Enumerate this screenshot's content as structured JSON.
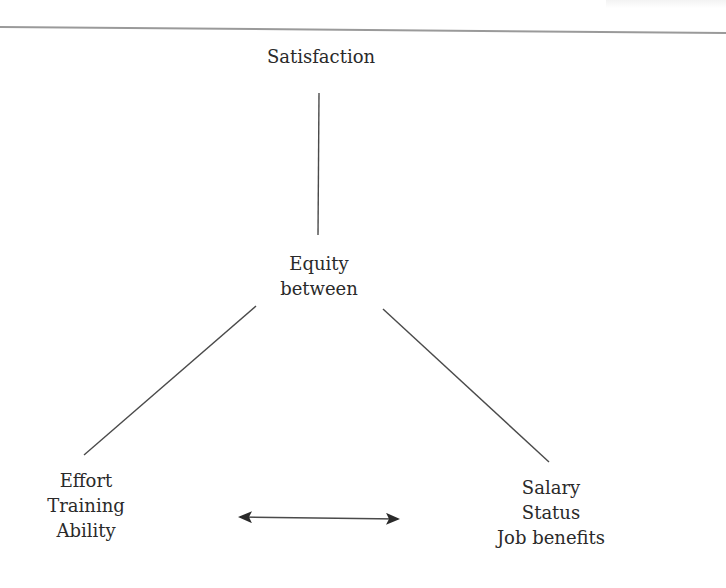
{
  "diagram": {
    "nodes": {
      "top": {
        "lines": [
          "Satisfaction"
        ]
      },
      "center": {
        "lines": [
          "Equity",
          "between"
        ]
      },
      "left": {
        "lines": [
          "Effort",
          "Training",
          "Ability"
        ]
      },
      "right": {
        "lines": [
          "Salary",
          "Status",
          "Job benefits"
        ]
      }
    },
    "edges": [
      {
        "from": "top",
        "to": "center",
        "type": "line"
      },
      {
        "from": "center",
        "to": "left",
        "type": "line"
      },
      {
        "from": "center",
        "to": "right",
        "type": "line"
      },
      {
        "from": "left",
        "to": "right",
        "type": "double-arrow"
      }
    ],
    "colors": {
      "line": "#4a4a4a",
      "text": "#2a2a2a",
      "rule": "#9a9a9a",
      "background": "#ffffff"
    }
  }
}
